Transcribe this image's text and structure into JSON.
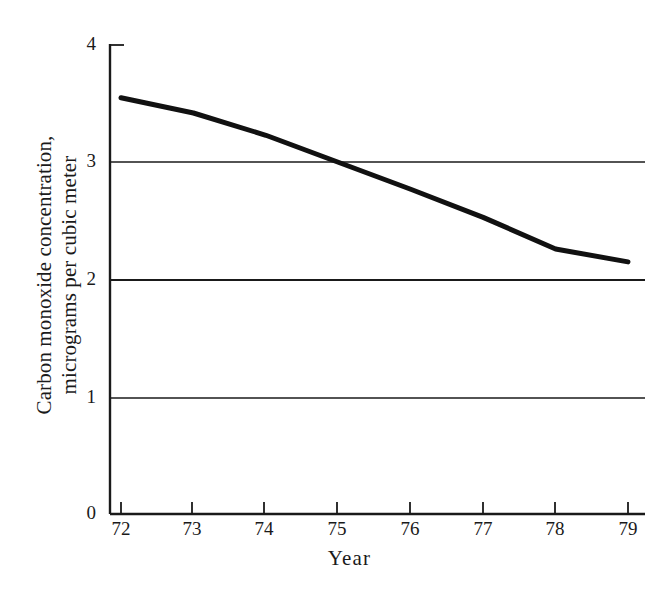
{
  "chart_data": {
    "type": "line",
    "title": "",
    "subtitle": "",
    "xlabel": "Year",
    "ylabel": "Carbon monoxide concentration, micrograms per cubic meter",
    "ylabel_line1": "Carbon monoxide concentration,",
    "ylabel_line2": "micrograms per cubic meter",
    "x": [
      72,
      73,
      74,
      75,
      76,
      77,
      78,
      79
    ],
    "xtick_labels": [
      "72",
      "73",
      "74",
      "75",
      "76",
      "77",
      "78",
      "79"
    ],
    "ytick_labels": [
      "0",
      "1",
      "2",
      "3",
      "4"
    ],
    "ytick_values": [
      0,
      1,
      2,
      3,
      4
    ],
    "values": [
      3.55,
      3.42,
      3.23,
      3.0,
      2.77,
      2.53,
      2.26,
      2.15
    ],
    "series": [
      {
        "name": "Carbon monoxide concentration",
        "values": [
          3.55,
          3.42,
          3.23,
          3.0,
          2.77,
          2.53,
          2.26,
          2.15
        ]
      }
    ],
    "xlim": [
      72,
      79
    ],
    "ylim": [
      0,
      4
    ],
    "grid": true,
    "gridlines_at": [
      1,
      2,
      3
    ],
    "legend": "none",
    "line_color": "#111111",
    "line_width": 5,
    "axis_color": "#1a1a1a",
    "grid_color": "#1a1a1a",
    "background": "#ffffff"
  },
  "axes": {
    "y_axis_name": "y-axis",
    "x_axis_name": "x-axis"
  }
}
